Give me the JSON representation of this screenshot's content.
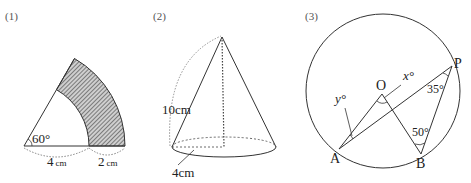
{
  "figures": [
    {
      "label": "(1)",
      "type": "sector-ring",
      "angle_label": "60°",
      "inner_radius_label": "4",
      "outer_width_label": "2",
      "unit": "cm"
    },
    {
      "label": "(2)",
      "type": "cone",
      "slant_label": "10cm",
      "radius_label": "4cm"
    },
    {
      "label": "(3)",
      "type": "circle-angles",
      "points": [
        "O",
        "A",
        "B",
        "P"
      ],
      "x_label": "x°",
      "y_label": "y°",
      "angle_p_label": "35°",
      "angle_b_label": "50°"
    }
  ],
  "colors": {
    "line": "#333333",
    "hatch": "#555555"
  }
}
